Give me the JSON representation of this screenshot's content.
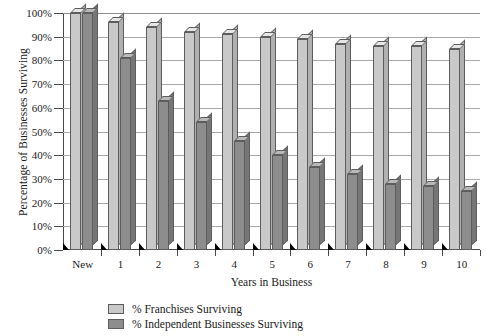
{
  "chart_data": {
    "type": "bar",
    "title": "",
    "xlabel": "Years in Business",
    "ylabel": "Percentage of Businesses Surviving",
    "categories": [
      "New",
      "1",
      "2",
      "3",
      "4",
      "5",
      "6",
      "7",
      "8",
      "9",
      "10"
    ],
    "series": [
      {
        "name": "% Franchises Surviving",
        "color": "#c9c9c9",
        "values": [
          100,
          96,
          94,
          92,
          91,
          90,
          89,
          87,
          86,
          86,
          85
        ]
      },
      {
        "name": "% Independent Businesses Surviving",
        "color": "#8d8d8d",
        "values": [
          100,
          81,
          63,
          54,
          46,
          40,
          35,
          32,
          28,
          27,
          25
        ]
      }
    ],
    "ylim": [
      0,
      100
    ],
    "ytick_labels": [
      "0%",
      "10%",
      "20%",
      "30%",
      "40%",
      "50%",
      "60%",
      "70%",
      "80%",
      "90%",
      "100%"
    ],
    "ytick_values": [
      0,
      10,
      20,
      30,
      40,
      50,
      60,
      70,
      80,
      90,
      100
    ],
    "grid": true,
    "legend_position": "bottom-center",
    "style": "3d-column"
  },
  "legend": {
    "items": [
      {
        "label": "% Franchises Surviving",
        "swatch": "light"
      },
      {
        "label": "% Independent Businesses Surviving",
        "swatch": "dark"
      }
    ]
  }
}
